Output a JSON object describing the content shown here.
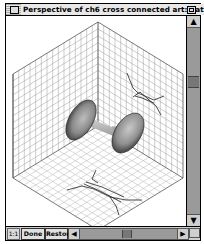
{
  "window": {
    "title": "Perspective of ch6 cross connected art:1 at 00:00:00",
    "close_icon": "close-box",
    "zoom_icon": "zoom-box"
  },
  "viewport": {
    "scene": "isometric cube with three gridded faces (left wall, right wall, floor)",
    "objects": [
      {
        "name": "trumpet-horn-surface",
        "description": "two-bell shaded surface connected by a narrow neck"
      },
      {
        "name": "wall-projection-lines",
        "description": "cross-connected line projection on right wall"
      },
      {
        "name": "floor-projection-lines",
        "description": "cross-connected line projection on floor"
      }
    ]
  },
  "statusbar": {
    "zoom_label": "1:1",
    "done_label": "Done",
    "restore_label": "Restore"
  },
  "scrollbars": {
    "vertical_up": "▲",
    "vertical_down": "▼",
    "horizontal_left": "◀",
    "horizontal_right": "▶"
  }
}
